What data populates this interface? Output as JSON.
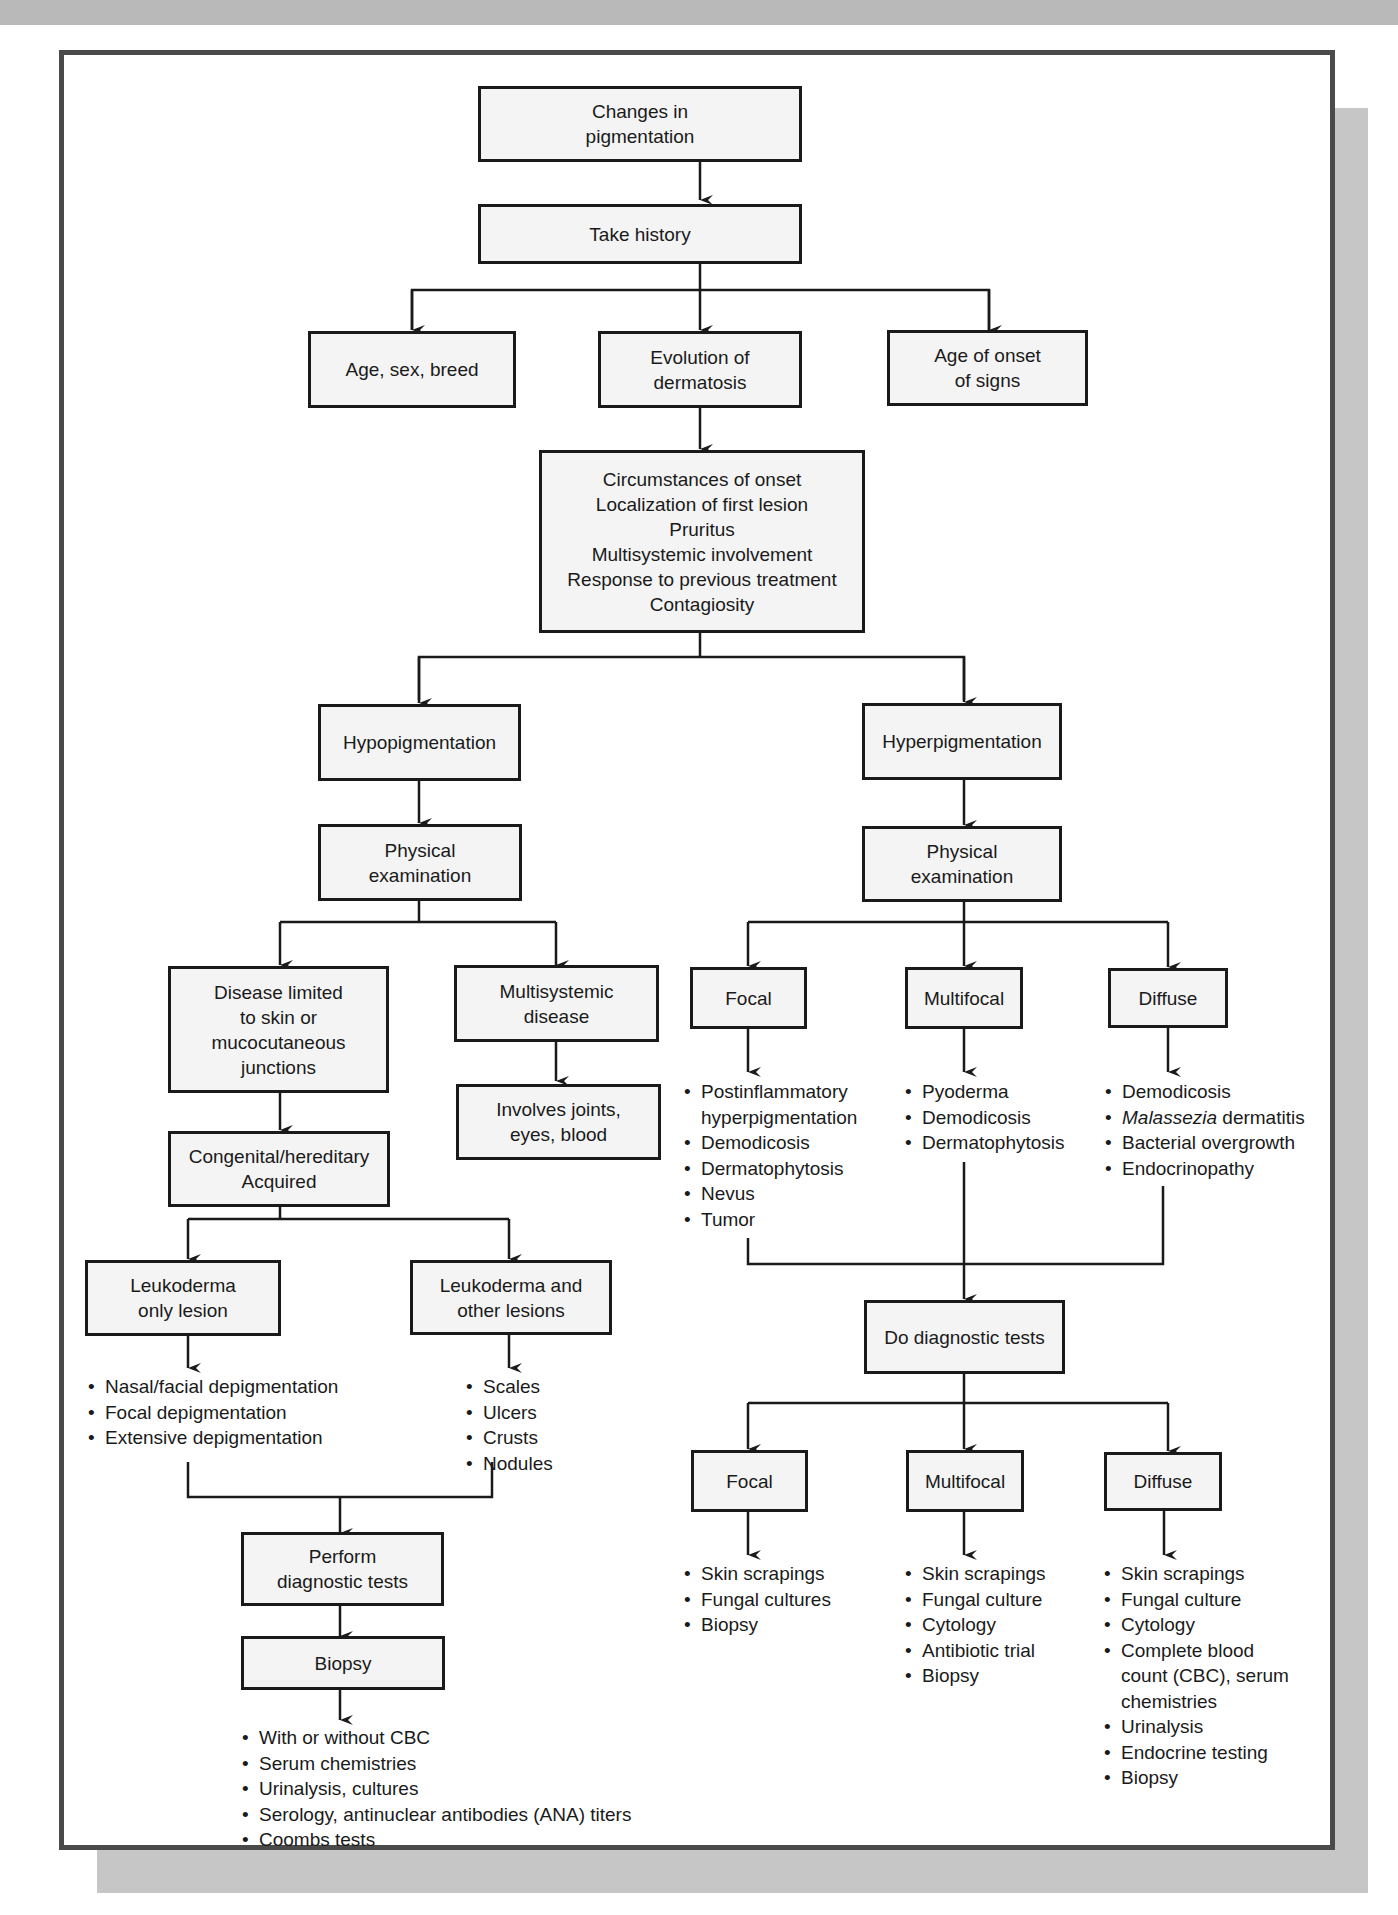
{
  "colors": {
    "frame_border": "#4a4a4a",
    "box_fill": "#f4f4f4",
    "box_border": "#1a1a1a",
    "shadow": "#c6c6c6",
    "background": "#ffffff"
  },
  "nodes": {
    "root": "Changes in\npigmentation",
    "take_history": "Take history",
    "age_sex_breed": "Age, sex, breed",
    "evolution": "Evolution of\ndermatosis",
    "age_onset": "Age of onset\nof signs",
    "history_details": "Circumstances of onset\nLocalization of first lesion\nPruritus\nMultisystemic involvement\nResponse to previous treatment\nContagiosity",
    "hypo": "Hypopigmentation",
    "hyper": "Hyperpigmentation",
    "hypo_exam": "Physical\nexamination",
    "hyper_exam": "Physical\nexamination",
    "limited_skin": "Disease limited\nto skin or\nmucocutaneous\njunctions",
    "multisystemic": "Multisystemic\ndisease",
    "involves": "Involves joints,\neyes, blood",
    "congenital": "Congenital/hereditary\nAcquired",
    "leuko_only": "Leukoderma\nonly lesion",
    "leuko_other": "Leukoderma and\nother lesions",
    "perform_tests": "Perform\ndiagnostic tests",
    "biopsy": "Biopsy",
    "hyper_focal": "Focal",
    "hyper_multifocal": "Multifocal",
    "hyper_diffuse": "Diffuse",
    "do_tests": "Do diagnostic tests",
    "test_focal": "Focal",
    "test_multifocal": "Multifocal",
    "test_diffuse": "Diffuse"
  },
  "lists": {
    "leuko_only": [
      "Nasal/facial depigmentation",
      "Focal depigmentation",
      "Extensive depigmentation"
    ],
    "leuko_other": [
      "Scales",
      "Ulcers",
      "Crusts",
      "Nodules"
    ],
    "biopsy": [
      "With or without CBC",
      "Serum chemistries",
      "Urinalysis, cultures",
      "Serology, antinuclear antibodies (ANA) titers",
      "Coombs tests"
    ],
    "hyper_focal": [
      "Postinflammatory\nhyperpigmentation",
      "Demodicosis",
      "Dermatophytosis",
      "Nevus",
      "Tumor"
    ],
    "hyper_multifocal": [
      "Pyoderma",
      "Demodicosis",
      "Dermatophytosis"
    ],
    "hyper_diffuse": [
      {
        "italic": "Malassezia",
        "text": ""
      },
      {
        "italic": "",
        "text": "Demodicosis"
      },
      {
        "italic": "Malassezia",
        "text": " dermatitis"
      },
      {
        "italic": "",
        "text": "Bacterial overgrowth"
      },
      {
        "italic": "",
        "text": "Endocrinopathy"
      }
    ],
    "test_focal": [
      "Skin scrapings",
      "Fungal cultures",
      "Biopsy"
    ],
    "test_multifocal": [
      "Skin scrapings",
      "Fungal culture",
      "Cytology",
      "Antibiotic trial",
      "Biopsy"
    ],
    "test_diffuse": [
      "Skin scrapings",
      "Fungal culture",
      "Cytology",
      "Complete blood\ncount (CBC), serum\nchemistries",
      "Urinalysis",
      "Endocrine testing",
      "Biopsy"
    ]
  }
}
